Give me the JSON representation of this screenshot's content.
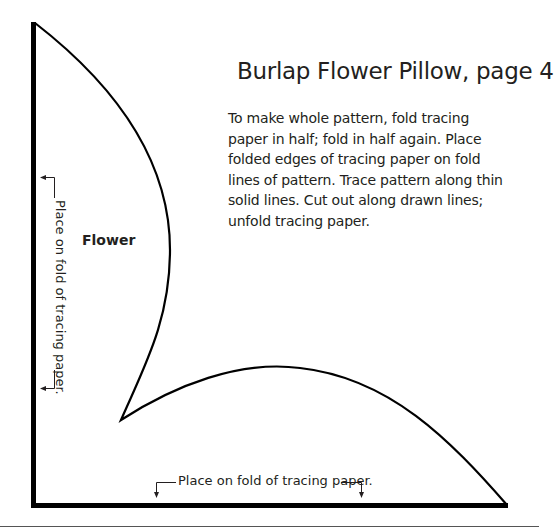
{
  "document": {
    "title": "Burlap Flower Pillow, page 4",
    "instructions_lines": [
      "To make whole pattern, fold tracing",
      "paper in half; fold in half again. Place",
      "folded edges of tracing paper on fold",
      "lines of pattern. Trace pattern along thin",
      "solid lines. Cut out along drawn lines;",
      "unfold tracing paper."
    ],
    "pattern_piece_label": "Flower",
    "fold_labels": {
      "left": "Place on fold of tracing paper.",
      "bottom": "Place on fold of tracing paper."
    }
  },
  "colors": {
    "ink": "#231f20",
    "background": "#ffffff"
  }
}
